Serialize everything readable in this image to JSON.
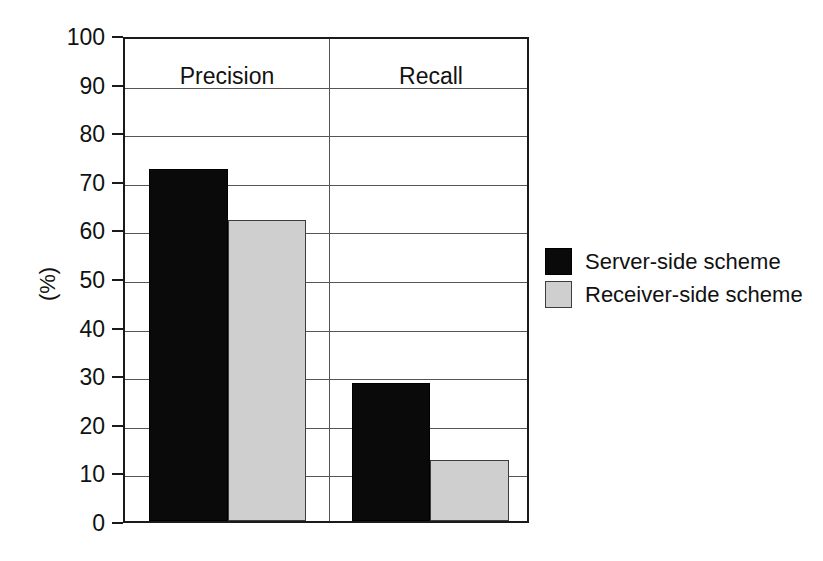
{
  "chart_data": {
    "type": "bar",
    "title": "",
    "subtitle": "",
    "xlabel": "",
    "ylabel": "(%)",
    "ylim": [
      0,
      100
    ],
    "ytick_step": 10,
    "yticks": [
      "100",
      "90",
      "80",
      "70",
      "60",
      "50",
      "40",
      "30",
      "20",
      "10",
      "0"
    ],
    "grid": true,
    "grid_axis": "y",
    "legend_position": "right",
    "categories": [
      "Precision",
      "Recall"
    ],
    "series": [
      {
        "name": "Server-side scheme",
        "color": "#0a0a0a",
        "values": [
          72.5,
          28.5
        ]
      },
      {
        "name": "Receiver-side scheme",
        "color": "#cfcfcf",
        "values": [
          62.0,
          12.5
        ]
      }
    ]
  },
  "legend": {
    "entries": [
      {
        "label": "Server-side scheme",
        "swatch": "black-square-swatch"
      },
      {
        "label": "Receiver-side scheme",
        "swatch": "gray-square-swatch"
      }
    ]
  },
  "axis": {
    "y_title": "(%)"
  },
  "colors": {
    "series_0": "#0a0a0a",
    "series_1": "#cfcfcf",
    "frame": "#1a1a1a",
    "gridline": "#555555",
    "text": "#111111",
    "background": "#ffffff"
  }
}
